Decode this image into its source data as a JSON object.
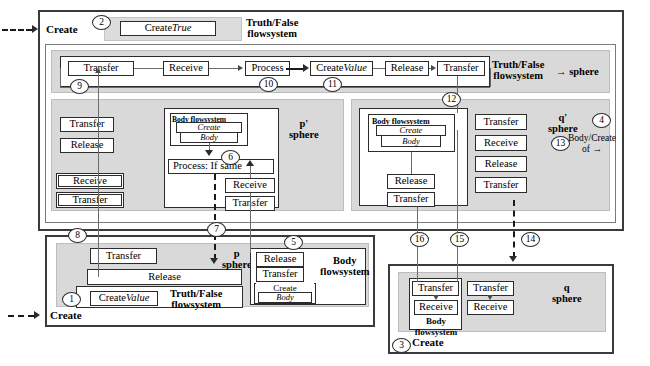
{
  "diagram": {
    "entry_points": [
      {
        "id": "entry-top",
        "label": "Create",
        "number": "2"
      },
      {
        "id": "entry-bottom-left",
        "label": "Create",
        "number": "1"
      },
      {
        "id": "entry-bottom-right",
        "label": "Create",
        "number": "3"
      }
    ],
    "spheres": {
      "main": {
        "label": "→ sphere"
      },
      "p_prime": {
        "label_line1": "p'",
        "label_line2": "sphere"
      },
      "q_prime": {
        "label_line1": "q'",
        "label_line2": "sphere",
        "number": "13"
      },
      "p": {
        "label_line1": "p",
        "label_line2": "sphere"
      },
      "q": {
        "label_line1": "q",
        "label_line2": "sphere"
      }
    },
    "flowsystems": {
      "truth_false_top": {
        "line1": "Truth/False",
        "line2": "flowsystem"
      },
      "truth_false_main": {
        "line1": "Truth/False",
        "line2": "flowsystem"
      },
      "truth_false_bottom": {
        "line1": "Truth/False",
        "line2": "flowsystem"
      },
      "body_p_prime": {
        "label": "Body flowsystem"
      },
      "body_q_prime": {
        "label": "Body flowsystem"
      },
      "body_p": {
        "line1": "Body",
        "line2": "flowsystem"
      },
      "body_q": {
        "line1": "Body",
        "line2": "flowsystem"
      }
    },
    "annotation_4": {
      "number": "4",
      "line1": "Body/Create",
      "line2": "of →"
    },
    "nodes": {
      "create_true": {
        "text": "Create ",
        "em": "True"
      },
      "main_transfer1": "Transfer",
      "main_receive": "Receive",
      "main_process": "Process",
      "main_create_value": {
        "text": "Create ",
        "em": "Value"
      },
      "main_release": "Release",
      "main_transfer2": "Transfer",
      "left_transfer1": "Transfer",
      "left_release": "Release",
      "left_receive": "Receive",
      "left_transfer2": "Transfer",
      "pp_create": "Create",
      "pp_body": "Body",
      "pp_process_if_same": "Process: If same",
      "pp_receive": "Receive",
      "pp_transfer": "Transfer",
      "qp_create": "Create",
      "qp_body": "Body",
      "qp_release": "Release",
      "qp_transfer": "Transfer",
      "col_transfer1": "Transfer",
      "col_receive": "Receive",
      "col_release": "Release",
      "col_transfer2": "Transfer",
      "p_transfer": "Transfer",
      "p_release": "Release",
      "p_create_value": {
        "text": "Create ",
        "em": "Value"
      },
      "bodyp_release": "Release",
      "bodyp_transfer": "Transfer",
      "bodyp_create": "Create",
      "bodyp_body": "Body",
      "q_transfer_a": "Transfer",
      "q_receive_a": "Receive",
      "q_transfer_b": "Transfer",
      "q_receive_b": "Receive"
    },
    "circle_numbers": [
      "1",
      "2",
      "3",
      "4",
      "5",
      "6",
      "7",
      "8",
      "9",
      "10",
      "11",
      "12",
      "13",
      "14",
      "15",
      "16"
    ],
    "colors": {
      "frame_dark": "#3a3a3a",
      "frame_light": "#7a7a7a",
      "shade": "#dcdcdc",
      "node_border": "#2b2b2b",
      "connector": "#6b6b6b",
      "background": "#ffffff"
    }
  }
}
